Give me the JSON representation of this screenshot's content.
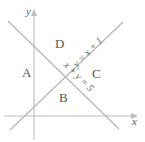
{
  "figure": {
    "background_color": "#ffffff",
    "line_color": "#b8b8b8",
    "axis_color": "#b8b8b8",
    "text_color": "#555555"
  },
  "axes": {
    "x_label": "x",
    "y_label": "y",
    "x_axis_y_pixel": 116,
    "y_axis_x_pixel": 34,
    "x_arrow": "right-arrow-icon",
    "y_arrow": "up-arrow-icon"
  },
  "lines": [
    {
      "name": "line-y-equals-x-plus-1",
      "equation": "y = x + 1",
      "slope": 1,
      "intercept": 1,
      "direction": "ascending"
    },
    {
      "name": "line-x-plus-y-equals-5",
      "equation": "x + y = 5",
      "slope": -1,
      "intercept": 5,
      "direction": "descending"
    }
  ],
  "regions": [
    {
      "id": "A",
      "label": "A",
      "position": "left"
    },
    {
      "id": "B",
      "label": "B",
      "position": "bottom"
    },
    {
      "id": "C",
      "label": "C",
      "position": "right"
    },
    {
      "id": "D",
      "label": "D",
      "position": "top"
    }
  ]
}
